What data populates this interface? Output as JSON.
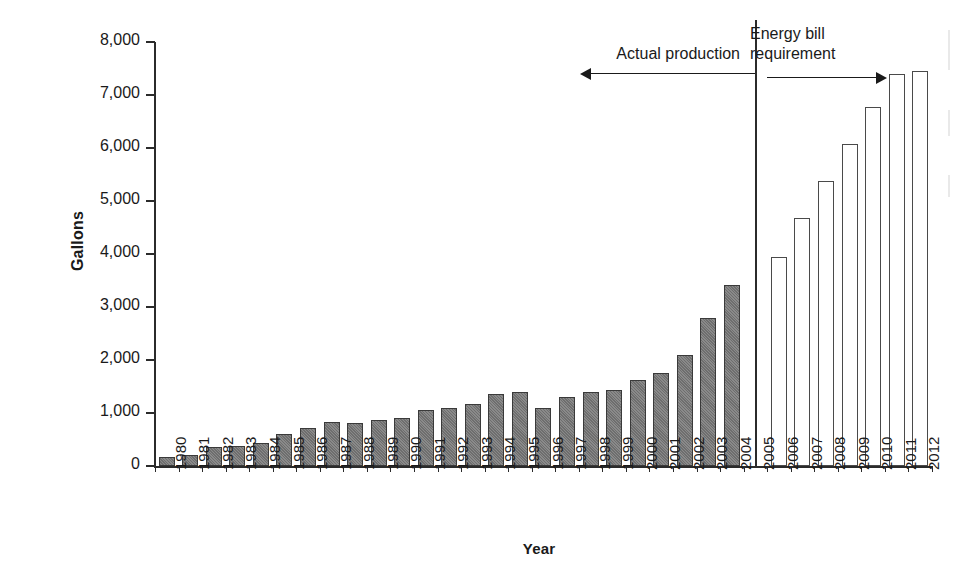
{
  "chart_data": {
    "type": "bar",
    "title": "",
    "xlabel": "Year",
    "ylabel": "Gallons",
    "ylim": [
      0,
      8000
    ],
    "ytick_labels": [
      "8,000",
      "7,000",
      "6,000",
      "5,000",
      "4,000",
      "3,000",
      "2,000",
      "1,000",
      "0"
    ],
    "ytick_values": [
      8000,
      7000,
      6000,
      5000,
      4000,
      3000,
      2000,
      1000,
      0
    ],
    "grid": false,
    "legend_position": "none",
    "categories": [
      "1980",
      "1981",
      "1982",
      "1983",
      "1984",
      "1985",
      "1986",
      "1987",
      "1988",
      "1989",
      "1990",
      "1991",
      "1992",
      "1993",
      "1994",
      "1995",
      "1996",
      "1997",
      "1998",
      "1999",
      "2000",
      "2001",
      "2002",
      "2003",
      "2004",
      "2005",
      "2006",
      "2007",
      "2008",
      "2009",
      "2010",
      "2011",
      "2012"
    ],
    "series": [
      {
        "name": "Actual production",
        "style": "filled-gray",
        "color": "#7d7d7d",
        "values": [
          175,
          215,
          350,
          375,
          430,
          610,
          710,
          830,
          815,
          860,
          900,
          1060,
          1100,
          1170,
          1350,
          1400,
          1100,
          1300,
          1400,
          1430,
          1620,
          1750,
          2090,
          2800,
          3410,
          null,
          null,
          null,
          null,
          null,
          null,
          null,
          null
        ]
      },
      {
        "name": "Energy bill requirement",
        "style": "outlined-white",
        "color": "#ffffff",
        "values": [
          null,
          null,
          null,
          null,
          null,
          null,
          null,
          null,
          null,
          null,
          null,
          null,
          null,
          null,
          null,
          null,
          null,
          null,
          null,
          null,
          null,
          null,
          null,
          null,
          null,
          null,
          3950,
          4680,
          5370,
          6070,
          6780,
          7400,
          7450
        ]
      }
    ],
    "annotations": [
      {
        "text": "Actual production",
        "arrow": "left",
        "at_category": "2005"
      },
      {
        "text": "Energy bill requirement",
        "arrow": "right",
        "at_category": "2005"
      }
    ],
    "divider": {
      "after_category": "2005",
      "style": "solid-vertical"
    }
  },
  "annotations": {
    "actual": "Actual production",
    "requirement_line1": "Energy bill",
    "requirement_line2": "requirement"
  },
  "axes": {
    "y_title": "Gallons",
    "x_title": "Year"
  }
}
